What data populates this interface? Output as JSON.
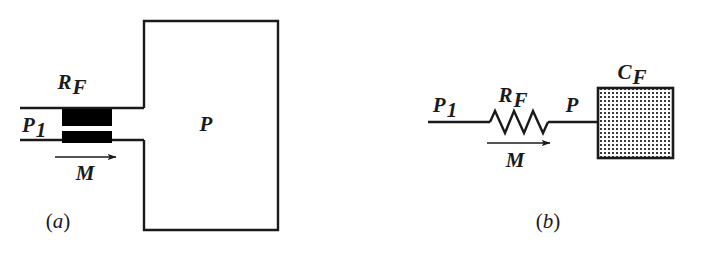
{
  "figure": {
    "type": "engineering-schematic",
    "background_color": "#ffffff",
    "line_color": "#1a1a1a"
  },
  "panel_a": {
    "caption": "(a)",
    "caption_open": "(",
    "caption_letter": "a",
    "caption_close": ")",
    "labels": {
      "restriction": "R",
      "restriction_sub": "F",
      "inlet_pressure": "P",
      "inlet_pressure_sub": "1",
      "chamber_pressure": "P",
      "mass_flow": "M"
    },
    "geometry": {
      "pipe_upper_y": 108,
      "pipe_lower_y": 140,
      "pipe_left_x": 20,
      "chamber_left_x": 144,
      "chamber_right_x": 278,
      "chamber_top_y": 21,
      "chamber_bottom_y": 230,
      "restriction_left_x": 62,
      "restriction_right_x": 112,
      "arrow_start_x": 55,
      "arrow_end_x": 118,
      "arrow_y": 157
    }
  },
  "panel_b": {
    "caption": "(b)",
    "caption_open": "(",
    "caption_letter": "b",
    "caption_close": ")",
    "labels": {
      "resistance": "R",
      "resistance_sub": "F",
      "inlet_pressure": "P",
      "inlet_pressure_sub": "1",
      "node_pressure": "P",
      "capacitance": "C",
      "capacitance_sub": "F",
      "mass_flow": "M"
    },
    "geometry": {
      "wire_y": 122,
      "wire_left_x": 428,
      "resistor_start_x": 490,
      "resistor_end_x": 548,
      "resistor_peaks": 3,
      "resistor_amplitude": 11,
      "capacitor_left_x": 598,
      "capacitor_right_x": 673,
      "capacitor_top_y": 88,
      "capacitor_bottom_y": 158,
      "arrow_start_x": 487,
      "arrow_end_x": 552,
      "arrow_y": 143
    },
    "capacitor_fill": "stippled-dot-pattern"
  }
}
